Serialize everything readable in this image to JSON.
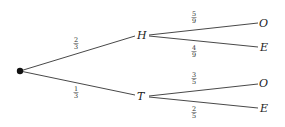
{
  "diagram": {
    "type": "probability-tree",
    "root": {
      "x": 20,
      "y": 71
    },
    "nodes": {
      "H": {
        "label": "H",
        "x": 141,
        "y": 35
      },
      "T": {
        "label": "T",
        "x": 141,
        "y": 96
      },
      "HO": {
        "label": "O",
        "x": 264,
        "y": 23
      },
      "HE": {
        "label": "E",
        "x": 264,
        "y": 47
      },
      "TO": {
        "label": "O",
        "x": 264,
        "y": 83
      },
      "TE": {
        "label": "E",
        "x": 264,
        "y": 108
      }
    },
    "edges": [
      {
        "from": "root",
        "to": "H",
        "num": "2",
        "den": "3"
      },
      {
        "from": "root",
        "to": "T",
        "num": "1",
        "den": "3"
      },
      {
        "from": "H",
        "to": "HO",
        "num": "5",
        "den": "9"
      },
      {
        "from": "H",
        "to": "HE",
        "num": "4",
        "den": "9"
      },
      {
        "from": "T",
        "to": "TO",
        "num": "3",
        "den": "5"
      },
      {
        "from": "T",
        "to": "TE",
        "num": "2",
        "den": "5"
      }
    ]
  }
}
